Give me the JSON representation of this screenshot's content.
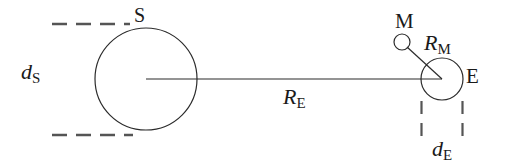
{
  "figure": {
    "type": "astronomy-scale-diagram",
    "background_color": "#ffffff",
    "stroke_color": "#2b2b2b",
    "text_color": "#1a1a1a",
    "width": 508,
    "height": 165
  },
  "labels": {
    "sun": "S",
    "earth": "E",
    "moon": "M",
    "sun_diameter": {
      "base": "d",
      "sub": "S"
    },
    "earth_diameter": {
      "base": "d",
      "sub": "E"
    },
    "sun_earth_distance": {
      "base": "R",
      "sub": "E"
    },
    "earth_moon_distance": {
      "base": "R",
      "sub": "M"
    }
  },
  "bodies": [
    {
      "name": "sun",
      "label": "S",
      "cx": 146,
      "cy": 79,
      "r": 51
    },
    {
      "name": "earth",
      "label": "E",
      "cx": 442,
      "cy": 79,
      "r": 21
    },
    {
      "name": "moon",
      "label": "M",
      "cx": 402,
      "cy": 42,
      "r": 8
    }
  ],
  "measures": [
    {
      "name": "sun-diameter",
      "symbol": "dS",
      "kind": "horizontal-dashed-extent"
    },
    {
      "name": "earth-diameter",
      "symbol": "dE",
      "kind": "vertical-dashed-extent"
    },
    {
      "name": "sun-earth-distance",
      "symbol": "RE",
      "kind": "solid-line"
    },
    {
      "name": "earth-moon-distance",
      "symbol": "RM",
      "kind": "solid-line"
    }
  ]
}
